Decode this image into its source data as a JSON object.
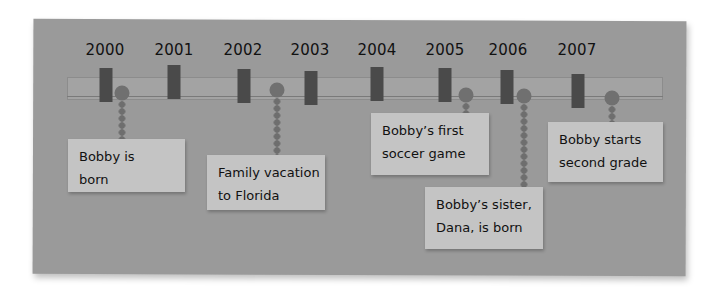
{
  "timeline": {
    "years": [
      {
        "label": "2000",
        "x": 105,
        "marker_x": 106,
        "marker_top": 68
      },
      {
        "label": "2001",
        "x": 174,
        "marker_x": 174,
        "marker_top": 65
      },
      {
        "label": "2002",
        "x": 243,
        "marker_x": 244,
        "marker_top": 69
      },
      {
        "label": "2003",
        "x": 310,
        "marker_x": 311,
        "marker_top": 71
      },
      {
        "label": "2004",
        "x": 377,
        "marker_x": 377,
        "marker_top": 67
      },
      {
        "label": "2005",
        "x": 445,
        "marker_x": 445,
        "marker_top": 68
      },
      {
        "label": "2006",
        "x": 508,
        "marker_x": 507,
        "marker_top": 70
      },
      {
        "label": "2007",
        "x": 577,
        "marker_x": 578,
        "marker_top": 74
      }
    ],
    "events": [
      {
        "year": "2000",
        "line1": "Bobby is",
        "line2": "born",
        "pin_x": 122,
        "pin_y": 93,
        "dots_top": 101,
        "dots_height": 38,
        "card_left": 68,
        "card_top": 139,
        "card_width": 117,
        "card_height": 53
      },
      {
        "year": "2002",
        "line1": "Family vacation",
        "line2": "to Florida",
        "pin_x": 277,
        "pin_y": 90,
        "dots_top": 98,
        "dots_height": 57,
        "card_left": 207,
        "card_top": 155,
        "card_width": 118,
        "card_height": 55
      },
      {
        "year": "2005",
        "line1": "Bobby’s first",
        "line2": "soccer game",
        "pin_x": 466,
        "pin_y": 95,
        "dots_top": 103,
        "dots_height": 14,
        "card_left": 371,
        "card_top": 113,
        "card_width": 118,
        "card_height": 62
      },
      {
        "year": "2006",
        "line1": "Bobby’s sister,",
        "line2": "Dana, is born",
        "pin_x": 524,
        "pin_y": 96,
        "dots_top": 104,
        "dots_height": 85,
        "card_left": 425,
        "card_top": 187,
        "card_width": 118,
        "card_height": 62
      },
      {
        "year": "2007",
        "line1": "Bobby starts",
        "line2": "second grade",
        "pin_x": 612,
        "pin_y": 98,
        "dots_top": 106,
        "dots_height": 16,
        "card_left": 548,
        "card_top": 122,
        "card_width": 115,
        "card_height": 60
      }
    ]
  },
  "colors": {
    "board": "#9a9a9a",
    "strip": "#a3a3a3",
    "marker": "#4a4a4a",
    "pin": "#707070",
    "card": "#c4c4c4",
    "text": "#111111"
  }
}
